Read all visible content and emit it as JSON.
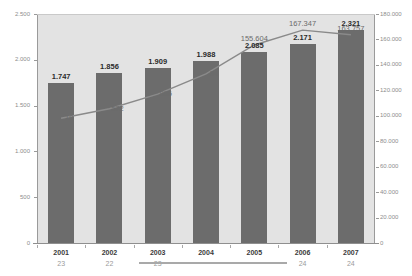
{
  "chart_data": {
    "type": "bar",
    "title": "",
    "subtitle": "",
    "xlabel": "",
    "ylabel": "",
    "categories": [
      "2001",
      "2002",
      "2003",
      "2004",
      "2005",
      "2006",
      "2007"
    ],
    "category_subrow": [
      "23",
      "22",
      "23",
      "",
      "",
      "24",
      "24"
    ],
    "grid": false,
    "legend_position": "bottom",
    "series": [
      {
        "name": "bars",
        "type": "bar",
        "axis": "left",
        "color": "#6c6c6c",
        "values": [
          1747,
          1856,
          1909,
          1988,
          2085,
          2171,
          2321
        ],
        "labels": [
          "1.747",
          "1.856",
          "1.909",
          "1.988",
          "2.085",
          "2.171",
          "2.321"
        ]
      },
      {
        "name": "line",
        "type": "line",
        "axis": "right",
        "color": "#8a8a8a",
        "values": [
          98010,
          105572,
          116996,
          133034,
          155604,
          167347,
          163757
        ],
        "labels": [
          "10",
          "572",
          "996",
          "34",
          "155.604",
          "167.347",
          "163.757"
        ]
      }
    ],
    "left_axis": {
      "min": 0,
      "max": 2500,
      "step": 500,
      "ticks": [
        "0",
        "500",
        "1.000",
        "1.500",
        "2.000",
        "2.500"
      ]
    },
    "right_axis": {
      "min": 0,
      "max": 180000,
      "step": 20000,
      "ticks": [
        "0",
        "20.000",
        "40.000",
        "60.000",
        "80.000",
        "100.000",
        "120.000",
        "140.000",
        "160.000",
        "180.000"
      ]
    },
    "colors": {
      "bar": "#6c6c6c",
      "line": "#8a8a8a",
      "plot_background": "#e3e3e3",
      "page_background": "#ffffff",
      "axis_text": "#8d8d8d",
      "value_text": "#2b2b2b"
    }
  }
}
